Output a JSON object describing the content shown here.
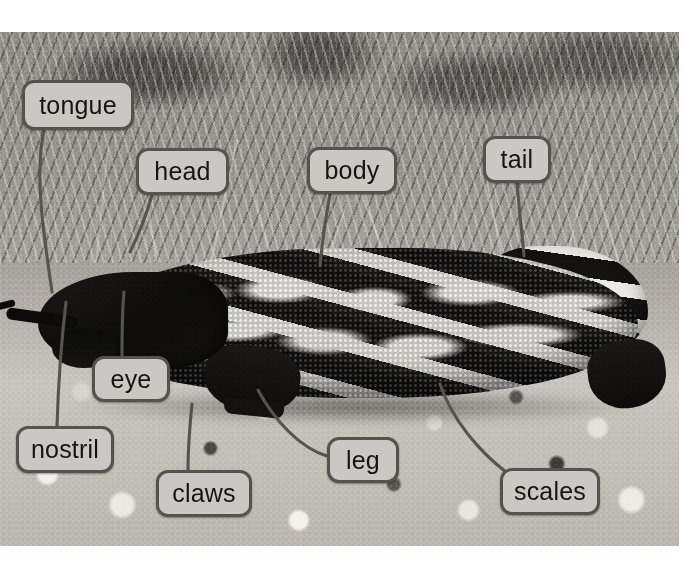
{
  "diagram": {
    "photo": {
      "style": "black-and-white photograph",
      "scene": "lizard on gravel ground with dry brush behind",
      "left": 0,
      "top": 32,
      "width": 679,
      "height": 514
    },
    "label_style": {
      "fill": "#c9c8c4",
      "border": "#56534e",
      "text": "#16150f",
      "leader": "#57534e",
      "radius": 12,
      "font_size": 25
    },
    "labels": [
      {
        "id": "tongue",
        "text": "tongue",
        "x": 22,
        "y": 80,
        "w": 112,
        "h": 50
      },
      {
        "id": "head",
        "text": "head",
        "x": 136,
        "y": 148,
        "w": 93,
        "h": 47
      },
      {
        "id": "body",
        "text": "body",
        "x": 307,
        "y": 147,
        "w": 90,
        "h": 47
      },
      {
        "id": "tail",
        "text": "tail",
        "x": 483,
        "y": 136,
        "w": 68,
        "h": 47
      },
      {
        "id": "eye",
        "text": "eye",
        "x": 92,
        "y": 356,
        "w": 78,
        "h": 46
      },
      {
        "id": "nostril",
        "text": "nostril",
        "x": 16,
        "y": 426,
        "w": 98,
        "h": 47
      },
      {
        "id": "claws",
        "text": "claws",
        "x": 156,
        "y": 470,
        "w": 96,
        "h": 47
      },
      {
        "id": "leg",
        "text": "leg",
        "x": 327,
        "y": 437,
        "w": 72,
        "h": 46
      },
      {
        "id": "scales",
        "text": "scales",
        "x": 500,
        "y": 468,
        "w": 100,
        "h": 47
      }
    ],
    "leaders": [
      {
        "id": "leader-tongue",
        "d": "M 44 130 C 34 176, 44 236, 52 292"
      },
      {
        "id": "leader-head",
        "d": "M 152 195 C 146 216, 138 236, 130 252"
      },
      {
        "id": "leader-body",
        "d": "M 330 194 C 326 216, 322 244, 320 266"
      },
      {
        "id": "leader-tail",
        "d": "M 517 183 C 519 208, 522 232, 524 256"
      },
      {
        "id": "leader-eye",
        "d": "M 122 356 C 122 334, 122 312, 124 292"
      },
      {
        "id": "leader-nostril",
        "d": "M 57 426 C 58 394, 60 352, 66 302"
      },
      {
        "id": "leader-claws",
        "d": "M 188 470 C 188 446, 190 424, 192 404"
      },
      {
        "id": "leader-leg",
        "d": "M 327 456 C 300 448, 274 420, 258 390"
      },
      {
        "id": "leader-scales",
        "d": "M 506 472 C 480 452, 452 420, 440 384"
      }
    ]
  }
}
